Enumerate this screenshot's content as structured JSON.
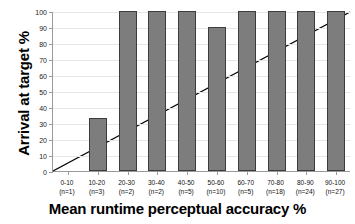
{
  "chart_data": {
    "type": "bar",
    "title": "",
    "xlabel": "Mean runtime perceptual accuracy %",
    "ylabel": "Arrival at target %",
    "categories": [
      "0-10",
      "10-20",
      "20-30",
      "30-40",
      "40-50",
      "50-60",
      "60-70",
      "70-80",
      "80-90",
      "90-100"
    ],
    "counts": [
      "(n=1)",
      "(n=3)",
      "(n=2)",
      "(n=2)",
      "(n=5)",
      "(n=10)",
      "(n=5)",
      "(n=18)",
      "(n=24)",
      "(n=27)"
    ],
    "values": [
      0,
      33,
      100,
      100,
      100,
      90,
      100,
      100,
      100,
      100
    ],
    "ylim": [
      0,
      100
    ],
    "yticks": [
      0,
      10,
      20,
      30,
      40,
      50,
      60,
      70,
      80,
      90,
      100
    ],
    "ytick_labels": [
      "0",
      "10",
      "20",
      "30",
      "40",
      "50",
      "60",
      "70",
      "80",
      "90",
      "100"
    ],
    "grid": true,
    "legend": "none",
    "bar_color": "#7d7d7d",
    "bar_border_color": "#3c3c3c",
    "gridline_color": "#e6e6e6",
    "axis_color": "#9a9a9a",
    "reference_line": {
      "name": "diagonal-identity-line",
      "color": "#000000",
      "x_start": 0,
      "y_start": 0,
      "x_end": 100,
      "y_end": 100
    }
  }
}
